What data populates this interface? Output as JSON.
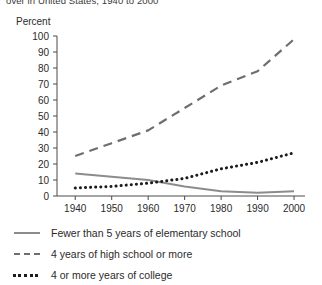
{
  "chart_data": {
    "type": "line",
    "title": "over in United States, 1940 to 2000",
    "ylabel": "Percent",
    "xlabel": "",
    "x": [
      1940,
      1950,
      1960,
      1970,
      1980,
      1990,
      2000
    ],
    "xlim": [
      1935,
      2003
    ],
    "ylim": [
      0,
      100
    ],
    "yticks": [
      0,
      10,
      20,
      30,
      40,
      50,
      60,
      70,
      80,
      90,
      100
    ],
    "xticks": [
      "1940",
      "1950",
      "1960",
      "1970",
      "1980",
      "1990",
      "2000"
    ],
    "grid": false,
    "legend_position": "below",
    "series": [
      {
        "name": "Fewer than 5 years of elementary school",
        "style": "solid",
        "color": "#8c8c8c",
        "values": [
          14,
          12,
          10,
          6,
          3,
          2,
          3
        ]
      },
      {
        "name": "4 years of high school or more",
        "style": "dashed",
        "color": "#6e6e6e",
        "values": [
          25,
          33,
          41,
          55,
          69,
          78,
          98
        ]
      },
      {
        "name": "4 or more years of college",
        "style": "dotted",
        "color": "#1c1c1c",
        "values": [
          5,
          6,
          8,
          11,
          17,
          21,
          27
        ]
      }
    ]
  },
  "legend": {
    "items": [
      {
        "label": "Fewer than 5 years of elementary school"
      },
      {
        "label": "4 years of high school or more"
      },
      {
        "label": "4 or more years of college"
      }
    ]
  }
}
